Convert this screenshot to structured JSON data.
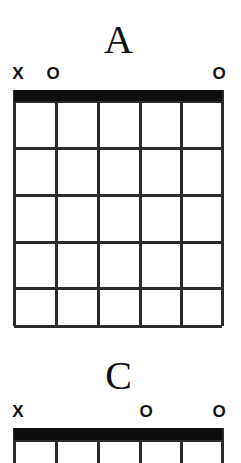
{
  "page": {
    "width": 241,
    "height": 463,
    "background_color": "#ffffff",
    "ink_color": "#101010",
    "document_type": "guitar-chord-chart"
  },
  "chords": [
    {
      "name": "A",
      "title": "A",
      "title_top": 20,
      "markers_top": 64,
      "grid": {
        "left": 14,
        "top": 90,
        "right": 222,
        "bottom": 326,
        "width": 208,
        "height": 236,
        "string_count": 6,
        "fret_count": 5,
        "nut_thickness": 11,
        "nut_color": "#0d0d0d",
        "line_color": "#2a2a2a",
        "string_x": [
          14,
          56,
          98,
          140,
          181,
          222
        ],
        "fret_y": [
          101,
          148,
          195,
          242,
          288,
          326
        ],
        "clipped_bottom": false
      },
      "string_markers": [
        {
          "symbol": "X",
          "x": 18,
          "string_index": 0,
          "meaning": "muted"
        },
        {
          "symbol": "O",
          "x": 53,
          "string_index": 1,
          "meaning": "open"
        },
        {
          "symbol": "O",
          "x": 219,
          "string_index": 5,
          "meaning": "open"
        }
      ],
      "fingerings": []
    },
    {
      "name": "C",
      "title": "C",
      "title_top": 356,
      "markers_top": 402,
      "grid": {
        "left": 14,
        "top": 428,
        "right": 222,
        "bottom": 463,
        "width": 208,
        "height": 35,
        "string_count": 6,
        "fret_count": 1,
        "nut_thickness": 12,
        "nut_color": "#0d0d0d",
        "line_color": "#2a2a2a",
        "string_x": [
          14,
          56,
          98,
          140,
          181,
          222
        ],
        "fret_y": [
          440
        ],
        "clipped_bottom": true
      },
      "string_markers": [
        {
          "symbol": "X",
          "x": 18,
          "string_index": 0,
          "meaning": "muted"
        },
        {
          "symbol": "O",
          "x": 146,
          "string_index": 3,
          "meaning": "open"
        },
        {
          "symbol": "O",
          "x": 219,
          "string_index": 5,
          "meaning": "open"
        }
      ],
      "fingerings": []
    }
  ]
}
